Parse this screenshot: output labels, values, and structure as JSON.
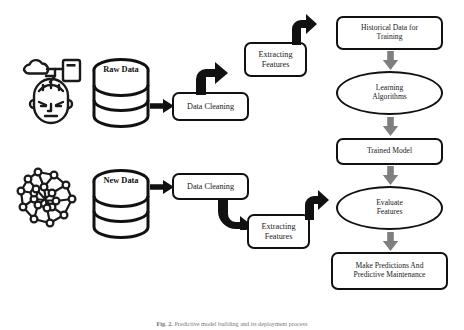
{
  "figure": {
    "caption_prefix": "Fig. 2.",
    "caption_text": "Predictive model building and its deployment process"
  },
  "icons": {
    "head_ai": "head-ai-cloud-icon",
    "network": "network-graph-icon"
  },
  "databases": [
    {
      "id": "raw-data",
      "label": "Raw Data"
    },
    {
      "id": "new-data",
      "label": "New Data"
    }
  ],
  "pipeline_top": {
    "data_cleaning": "Data Cleaning",
    "extracting_features": "Extracting\nFeatures",
    "extracting_features_line1": "Extracting",
    "extracting_features_line2": "Features"
  },
  "pipeline_bottom": {
    "data_cleaning": "Data Cleaning",
    "extracting_features_line1": "Extracting",
    "extracting_features_line2": "Features"
  },
  "right_column": [
    {
      "id": "historical-data",
      "shape": "rounded-rect",
      "line1": "Historical Data for",
      "line2": "Training"
    },
    {
      "id": "learning-algorithms",
      "shape": "ellipse",
      "line1": "Learning",
      "line2": "Algorithms"
    },
    {
      "id": "trained-model",
      "shape": "rounded-rect",
      "line1": "Trained Model",
      "line2": ""
    },
    {
      "id": "evaluate-features",
      "shape": "ellipse",
      "line1": "Evaluate",
      "line2": "Features"
    },
    {
      "id": "make-predictions",
      "shape": "rounded-rect",
      "line1": "Make Predictions And",
      "line2": "Predictive Maintenance"
    }
  ],
  "colors": {
    "stroke": "#111111",
    "arrow_gray": "#7f7f7f",
    "background": "#ffffff",
    "caption": "#7a7a7a"
  }
}
